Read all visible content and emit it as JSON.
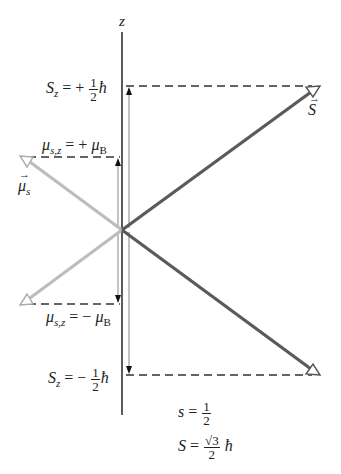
{
  "axis": {
    "label": "z"
  },
  "labels": {
    "sz_plus": {
      "lhs": "S",
      "sub": "z",
      "eq": "= +",
      "num": "1",
      "den": "2",
      "hbar": "ħ"
    },
    "sz_minus": {
      "lhs": "S",
      "sub": "z",
      "eq": "= −",
      "num": "1",
      "den": "2",
      "hbar": "ħ"
    },
    "mu_plus": {
      "lhs": "μ",
      "sub": "s,z",
      "eq": "= +",
      "rhs": "μ",
      "rhs_sub": "B"
    },
    "mu_minus": {
      "lhs": "μ",
      "sub": "s,z",
      "eq": "= −",
      "rhs": "μ",
      "rhs_sub": "B"
    },
    "spin_vector": "S",
    "moment_vector": "μ",
    "moment_vector_sub": "s",
    "s_value": {
      "lhs": "s",
      "eq": "=",
      "num": "1",
      "den": "2"
    },
    "S_value": {
      "lhs": "S",
      "eq": "=",
      "num": "√3",
      "den": "2",
      "hbar": "ħ"
    }
  },
  "colors": {
    "spin_arrow": "#5a5a5a",
    "moment_arrow": "#bdbdbd",
    "axis": "#333333",
    "dashed": "#333333"
  }
}
